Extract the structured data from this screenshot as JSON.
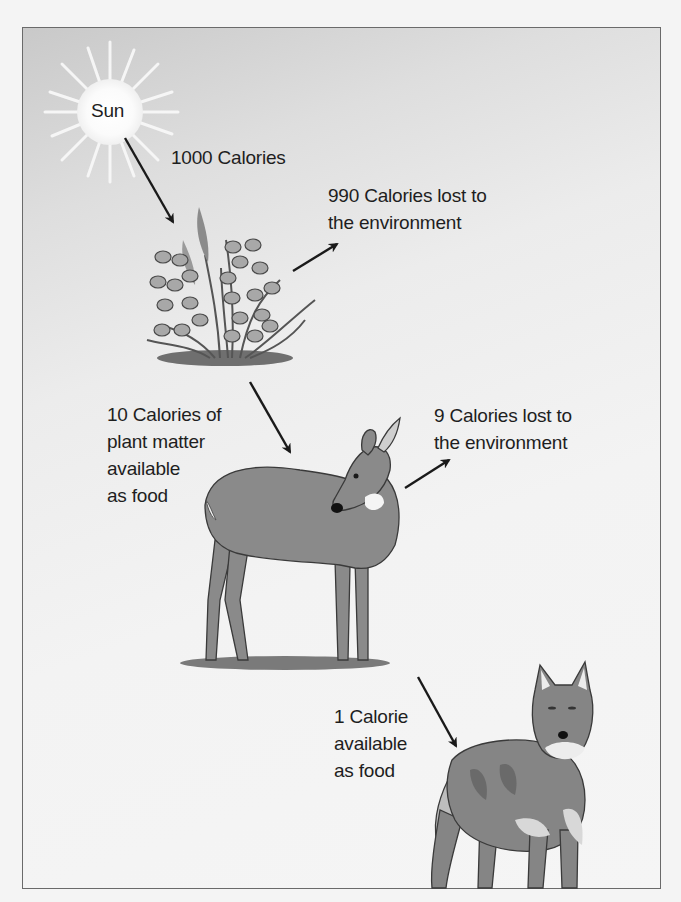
{
  "sun": {
    "label": "Sun"
  },
  "labels": {
    "sun_energy": "1000 Calories",
    "plant_lost_line1": "990 Calories lost to",
    "plant_lost_line2": "the environment",
    "plant_available_line1": "10 Calories of",
    "plant_available_line2": "plant matter",
    "plant_available_line3": "available",
    "plant_available_line4": "as food",
    "deer_lost_line1": "9 Calories lost to",
    "deer_lost_line2": "the environment",
    "deer_available_line1": "1 Calorie",
    "deer_available_line2": "available",
    "deer_available_line3": "as food"
  },
  "organisms": [
    "sun",
    "plants",
    "deer",
    "wolf"
  ],
  "colors": {
    "frame": "#6a6a6a",
    "text": "#1e1e1e",
    "animal": "#8a8a8a",
    "arrow": "#1a1a1a"
  }
}
